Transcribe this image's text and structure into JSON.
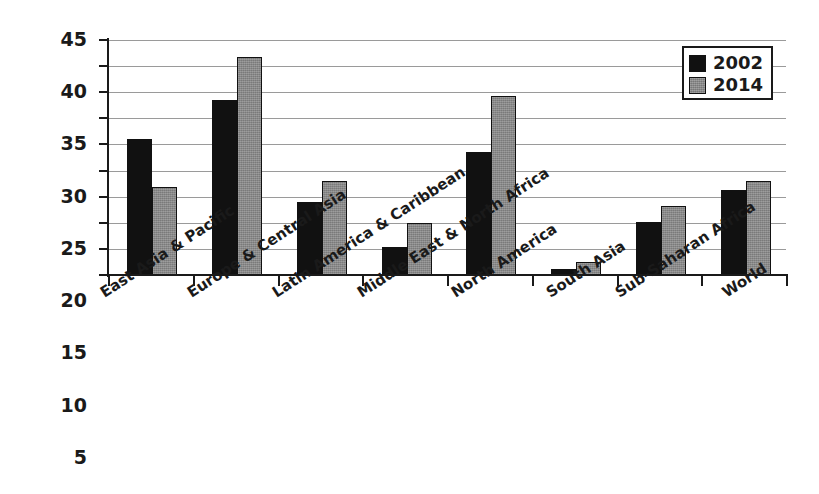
{
  "chart_data": {
    "type": "bar",
    "title": "",
    "subtitle": "",
    "xlabel": "",
    "ylabel": "",
    "ylim": [
      0,
      45
    ],
    "ytick_step": 5,
    "yticks": [
      0,
      5,
      10,
      15,
      20,
      25,
      30,
      35,
      40,
      45
    ],
    "ytick_labels": [
      "0",
      "5",
      "10",
      "15",
      "20",
      "25",
      "30",
      "35",
      "40",
      "45"
    ],
    "grid": true,
    "grid_axis": "y",
    "legend_position": "top-right",
    "categories": [
      "East Asia & Pacific",
      "Europe & Central Asia",
      "Latin America & Caribbean",
      "Middle East & North Africa",
      "North America",
      "South Asia",
      "Sub-Saharan Africa",
      "World"
    ],
    "series": [
      {
        "name": "2002",
        "color": "#111111",
        "values": [
          26.0,
          33.5,
          14.0,
          5.3,
          23.5,
          1.2,
          10.2,
          16.3
        ]
      },
      {
        "name": "2014",
        "color": "#8a8a8a",
        "values": [
          16.8,
          41.7,
          18.0,
          10.0,
          34.3,
          2.5,
          13.3,
          18.0
        ]
      }
    ]
  },
  "legend": {
    "entries": [
      {
        "label": "2002",
        "swatch": "black-square"
      },
      {
        "label": "2014",
        "swatch": "gray-square"
      }
    ]
  }
}
